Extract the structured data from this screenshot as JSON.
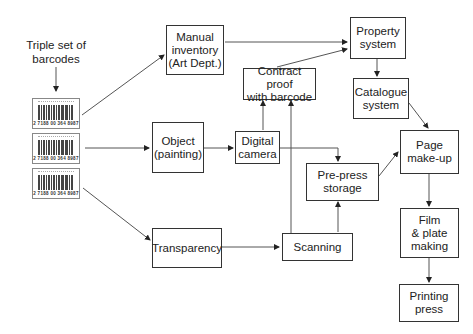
{
  "caption": {
    "line1": "Triple set of",
    "line2": "barcodes"
  },
  "barcodes": [
    {
      "number": "2 7188 00 364 8987"
    },
    {
      "number": "2 7188 00 364 8987"
    },
    {
      "number": "2 7188 00 364 8987"
    }
  ],
  "nodes": {
    "manual_inventory": {
      "line1": "Manual",
      "line2": "inventory",
      "line3": "(Art Dept.)"
    },
    "property_system": {
      "line1": "Property",
      "line2": "system"
    },
    "contract_proof": {
      "line1": "Contract proof",
      "line2": "with barcode"
    },
    "catalogue_system": {
      "line1": "Catalogue",
      "line2": "system"
    },
    "object": {
      "line1": "Object",
      "line2": "(painting)"
    },
    "digital_camera": {
      "line1": "Digital",
      "line2": "camera"
    },
    "prepress_storage": {
      "line1": "Pre-press",
      "line2": "storage"
    },
    "page_makeup": {
      "line1": "Page",
      "line2": "make-up"
    },
    "transparency": {
      "line1": "Transparency"
    },
    "scanning": {
      "line1": "Scanning"
    },
    "film_plate": {
      "line1": "Film",
      "line2": "& plate",
      "line3": "making"
    },
    "printing_press": {
      "line1": "Printing",
      "line2": "press"
    }
  },
  "edges": [
    {
      "from": "caption",
      "to": "barcodes"
    },
    {
      "from": "barcode_1",
      "to": "manual_inventory"
    },
    {
      "from": "barcode_2",
      "to": "object"
    },
    {
      "from": "barcode_3",
      "to": "transparency"
    },
    {
      "from": "manual_inventory",
      "to": "property_system"
    },
    {
      "from": "contract_proof",
      "to": "property_system"
    },
    {
      "from": "property_system",
      "to": "catalogue_system"
    },
    {
      "from": "catalogue_system",
      "to": "page_makeup"
    },
    {
      "from": "object",
      "to": "digital_camera"
    },
    {
      "from": "digital_camera",
      "to": "contract_proof"
    },
    {
      "from": "digital_camera",
      "to": "prepress_storage"
    },
    {
      "from": "scanning",
      "to": "contract_proof"
    },
    {
      "from": "scanning",
      "to": "prepress_storage"
    },
    {
      "from": "transparency",
      "to": "scanning"
    },
    {
      "from": "prepress_storage",
      "to": "page_makeup"
    },
    {
      "from": "page_makeup",
      "to": "film_plate"
    },
    {
      "from": "film_plate",
      "to": "printing_press"
    }
  ]
}
